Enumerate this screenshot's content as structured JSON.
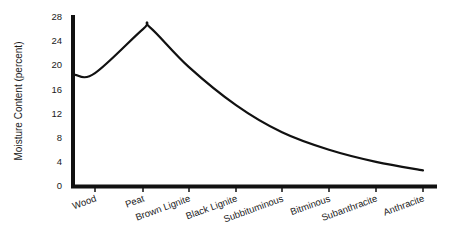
{
  "chart_data": {
    "type": "line",
    "title": "",
    "xlabel": "",
    "ylabel": "Moisture Content (percent)",
    "ylim": [
      0,
      28
    ],
    "yticks": [
      0,
      4,
      8,
      12,
      16,
      20,
      24,
      28
    ],
    "grid": false,
    "legend": null,
    "categories": [
      "Wood",
      "Peat",
      "Brown Lignite",
      "Black Lignite",
      "Subbituminous",
      "Bitminous",
      "Subanthracite",
      "Anthracite"
    ],
    "series": [
      {
        "name": "Moisture Content",
        "values": [
          18.7,
          26.0,
          19.7,
          13.4,
          8.9,
          6.0,
          4.0,
          2.6
        ],
        "start_value_at_axis": 18.4,
        "peak": {
          "between": [
            "Peat",
            "Brown Lignite"
          ],
          "near": "Peat",
          "value": 26.3
        }
      }
    ],
    "colors": {
      "line": "#111111",
      "axis": "#111111",
      "text": "#1a1a1a",
      "background": "#ffffff"
    }
  },
  "axes": {
    "y_title": "Moisture Content (percent)",
    "y_ticks": [
      "0",
      "4",
      "8",
      "12",
      "16",
      "20",
      "24",
      "28"
    ],
    "x_ticks": [
      "Wood",
      "Peat",
      "Brown Lignite",
      "Black Lignite",
      "Subbituminous",
      "Bitminous",
      "Subanthracite",
      "Anthracite"
    ]
  }
}
